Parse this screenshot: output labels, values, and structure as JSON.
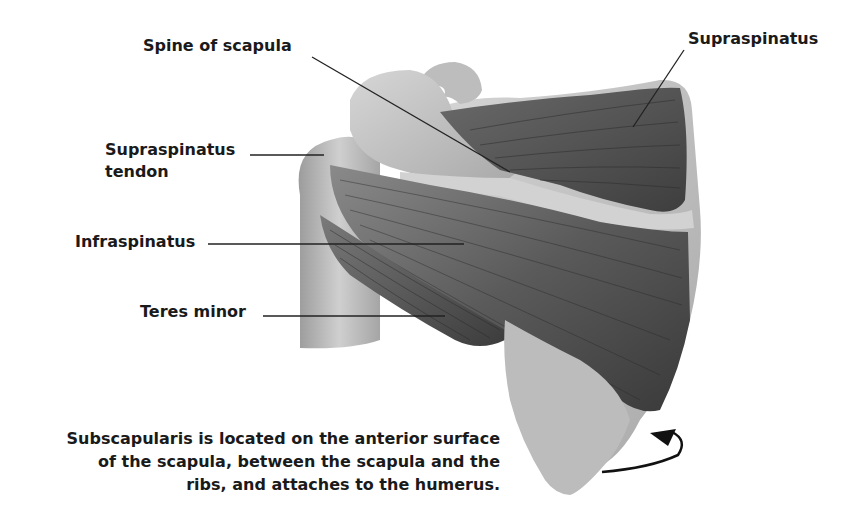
{
  "diagram": {
    "labels": [
      {
        "id": "spine-of-scapula",
        "text": "Spine of scapula"
      },
      {
        "id": "supraspinatus",
        "text": "Supraspinatus"
      },
      {
        "id": "supraspinatus-tendon",
        "line1": "Supraspinatus",
        "line2": "tendon"
      },
      {
        "id": "infraspinatus",
        "text": "Infraspinatus"
      },
      {
        "id": "teres-minor",
        "text": "Teres minor"
      }
    ],
    "caption": {
      "line1": "Subscapularis is located on the anterior surface",
      "line2": "of the scapula, between the scapula and the",
      "line3": "ribs, and attaches to the humerus."
    },
    "colors": {
      "background": "#ffffff",
      "bone": "#c8c8c8",
      "bone_shadow": "#9a9a9a",
      "muscle_dark": "#4a4a4a",
      "muscle_mid": "#6e6e6e",
      "leader_line": "#222222",
      "text": "#1a1a1a"
    }
  }
}
